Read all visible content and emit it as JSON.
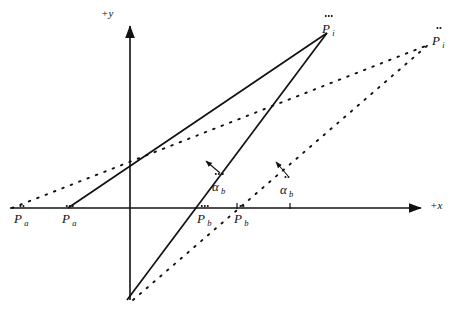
{
  "figure": {
    "background_color": "#ffffff",
    "ink_color": "#111111",
    "width": 461,
    "height": 319
  },
  "axes": {
    "x_label": "+x",
    "y_label": "+y",
    "origin": {
      "x": 130,
      "y": 208
    },
    "x_axis": {
      "start_x": 10,
      "end_x": 425,
      "y": 208
    },
    "y_axis": {
      "x": 130,
      "start_y": 300,
      "end_y": 22
    },
    "ticks": [
      {
        "name": "tick-alpha-triple",
        "x": 237,
        "y": 208
      },
      {
        "name": "tick-alpha-double",
        "x": 290,
        "y": 208
      }
    ]
  },
  "labels": {
    "p_a_double": {
      "text": "P",
      "dots": 2,
      "sub": "a",
      "x": 14,
      "y": 210
    },
    "p_a_triple": {
      "text": "P",
      "dots": 3,
      "sub": "a",
      "x": 62,
      "y": 210
    },
    "p_b_triple": {
      "text": "P",
      "dots": 3,
      "sub": "b",
      "x": 197,
      "y": 210
    },
    "p_b_double": {
      "text": "P",
      "dots": 2,
      "sub": "b",
      "x": 234,
      "y": 210
    },
    "p_i_triple": {
      "text": "P",
      "dots": 3,
      "sub": "i",
      "x": 322,
      "y": 20
    },
    "p_i_double": {
      "text": "P",
      "dots": 2,
      "sub": "i",
      "x": 432,
      "y": 32
    },
    "alpha_b_triple": {
      "text": "α",
      "dots": 3,
      "sub": "b",
      "x": 212,
      "y": 178
    },
    "alpha_b_double": {
      "text": "α",
      "dots": 2,
      "sub": "b",
      "x": 280,
      "y": 181
    }
  },
  "solid_lines": [
    {
      "name": "line-pa-triple-to-pi-triple",
      "x1": 68,
      "y1": 208,
      "x2": 327,
      "y2": 33
    },
    {
      "name": "line-pb-triple-to-pi-triple",
      "x1": 127,
      "y1": 300,
      "x2": 327,
      "y2": 33
    }
  ],
  "dotted_lines": [
    {
      "name": "dotted-pa-double-to-pi-double",
      "x1": 12,
      "y1": 208,
      "x2": 428,
      "y2": 45
    },
    {
      "name": "dotted-pb-double-to-pi-double",
      "x1": 133,
      "y1": 300,
      "x2": 428,
      "y2": 45
    }
  ],
  "pointers": [
    {
      "name": "pointer-alpha-triple",
      "x1": 219,
      "y1": 172,
      "x2": 206,
      "y2": 162
    },
    {
      "name": "pointer-alpha-double",
      "x1": 287,
      "y1": 175,
      "x2": 276,
      "y2": 163
    }
  ]
}
